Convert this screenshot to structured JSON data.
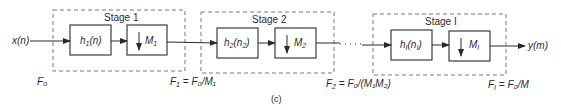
{
  "diagram": {
    "type": "multistage decimator block diagram",
    "input": {
      "label": "x(n)",
      "rate": "F₀"
    },
    "output": {
      "label": "y(m)"
    },
    "stages": [
      {
        "title": "Stage 1",
        "filter": {
          "name": "h",
          "sub": "1",
          "arg": "n",
          "arg_sub": ""
        },
        "decimator": {
          "name": "M",
          "sub": "1"
        },
        "output_rate": {
          "lhs": "F",
          "lhs_sub": "1",
          "rhs": " = F₀/M₁"
        }
      },
      {
        "title": "Stage 2",
        "filter": {
          "name": "h",
          "sub": "2",
          "arg": "n",
          "arg_sub": "2"
        },
        "decimator": {
          "name": "M",
          "sub": "2"
        },
        "output_rate": {
          "lhs": "F",
          "lhs_sub": "2",
          "rhs": " = F₀/(M₁M₂)"
        }
      },
      {
        "title": "Stage I",
        "filter": {
          "name": "h",
          "sub": "I",
          "arg": "n",
          "arg_sub": "I"
        },
        "decimator": {
          "name": "M",
          "sub": "I"
        },
        "output_rate": {
          "lhs": "F",
          "lhs_sub": "I",
          "rhs": " = F₀/M"
        }
      }
    ],
    "ellipsis": "· · ·",
    "caption": "(c)"
  },
  "labels": {
    "input": "x(n)",
    "output": "y(m)",
    "f0": "F₀",
    "stage1_title": "Stage 1",
    "stage2_title": "Stage 2",
    "stageI_title": "Stage I",
    "h1_name": "h",
    "h1_sub": "1",
    "h1_arg": "(n)",
    "h2_name": "h",
    "h2_sub": "2",
    "h2_arg_open": "(n",
    "h2_arg_sub": "2",
    "h2_arg_close": ")",
    "hI_name": "h",
    "hI_sub": "I",
    "hI_arg_open": "(n",
    "hI_arg_sub": "I",
    "hI_arg_close": ")",
    "m1_name": "M",
    "m1_sub": "1",
    "m2_name": "M",
    "m2_sub": "2",
    "mI_name": "M",
    "mI_sub": "I",
    "f1_lhs": "F",
    "f1_sub": "1",
    "f1_rhs": " = F₀/M₁",
    "f2_lhs": "F",
    "f2_sub": "2",
    "f2_rhs": " = F₀/(M₁M₂)",
    "fI_lhs": "F",
    "fI_sub": "I",
    "fI_rhs": " = F₀/M",
    "caption": "(c)"
  },
  "colors": {
    "line": "#2a2a2a",
    "dashed": "#6a6a6a",
    "background": "#ffffff"
  }
}
